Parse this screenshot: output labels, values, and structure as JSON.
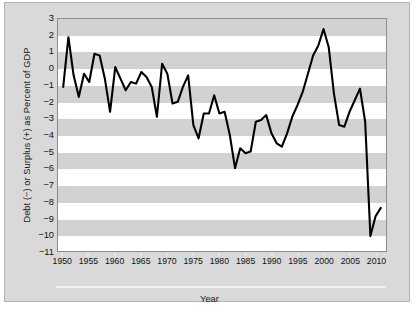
{
  "chart_data": {
    "type": "line",
    "title": "",
    "xlabel": "Year",
    "ylabel": "Debt (−) or Surplus (+) as Percent of GDP",
    "xlim": [
      1949,
      2012
    ],
    "ylim": [
      -11,
      3
    ],
    "grid": "horizontal alternating gray bands, 1 unit tall",
    "legend": "none",
    "y_ticks": [
      3,
      2,
      1,
      0,
      -1,
      -2,
      -3,
      -4,
      -5,
      -6,
      -7,
      -8,
      -9,
      -10,
      -11
    ],
    "y_tick_labels": [
      "3",
      "2",
      "1",
      "0",
      "−1",
      "−2",
      "−3",
      "−4",
      "−5",
      "−6",
      "−7",
      "−8",
      "−9",
      "−10",
      "−11"
    ],
    "x_ticks": [
      1950,
      1955,
      1960,
      1965,
      1970,
      1975,
      1980,
      1985,
      1990,
      1995,
      2000,
      2005,
      2010
    ],
    "x_tick_labels": [
      "1950",
      "1955",
      "1960",
      "1965",
      "1970",
      "1975",
      "1980",
      "1985",
      "1990",
      "1995",
      "2000",
      "2005",
      "2010"
    ],
    "series": [
      {
        "name": "Federal Deficit (−) or Surplus (+) as Percent of GDP",
        "color": "#000000",
        "x": [
          1950,
          1951,
          1952,
          1953,
          1954,
          1955,
          1956,
          1957,
          1958,
          1959,
          1960,
          1961,
          1962,
          1963,
          1964,
          1965,
          1966,
          1967,
          1968,
          1969,
          1970,
          1971,
          1972,
          1973,
          1974,
          1975,
          1976,
          1977,
          1978,
          1979,
          1980,
          1981,
          1982,
          1983,
          1984,
          1985,
          1986,
          1987,
          1988,
          1989,
          1990,
          1991,
          1992,
          1993,
          1994,
          1995,
          1996,
          1997,
          1998,
          1999,
          2000,
          2001,
          2002,
          2003,
          2004,
          2005,
          2006,
          2007,
          2008,
          2009,
          2010,
          2011
        ],
        "values": [
          -1.1,
          1.9,
          -0.4,
          -1.7,
          -0.3,
          -0.8,
          0.9,
          0.8,
          -0.6,
          -2.6,
          0.1,
          -0.6,
          -1.3,
          -0.8,
          -0.9,
          -0.2,
          -0.5,
          -1.1,
          -2.9,
          0.3,
          -0.3,
          -2.1,
          -2.0,
          -1.1,
          -0.4,
          -3.4,
          -4.2,
          -2.7,
          -2.7,
          -1.6,
          -2.7,
          -2.6,
          -4.0,
          -6.0,
          -4.8,
          -5.1,
          -5.0,
          -3.2,
          -3.1,
          -2.8,
          -3.9,
          -4.5,
          -4.7,
          -3.9,
          -2.9,
          -2.2,
          -1.4,
          -0.3,
          0.8,
          1.4,
          2.4,
          1.3,
          -1.5,
          -3.4,
          -3.5,
          -2.6,
          -1.9,
          -1.2,
          -3.2,
          -10.1,
          -8.9,
          -8.4
        ]
      }
    ]
  },
  "axes": {
    "ylabel_text": "Debt (−) or Surplus (+) as Percent of GDP",
    "xlabel_text": "Year"
  }
}
